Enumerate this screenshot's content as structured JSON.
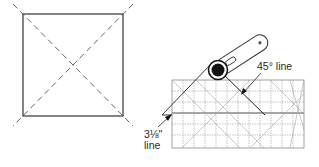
{
  "figures": {
    "left": {
      "name": "square-with-diagonals",
      "description": "Square block with two dashed diagonal placement lines extending past the corners"
    },
    "right": {
      "name": "ruler-and-rotary-cutter",
      "description": "Rotary cutter trimming along a quilting ruler aligned to the diagonal"
    }
  },
  "labels": {
    "angle_line": "45° line",
    "measure_line_top": "3⅛\"",
    "measure_line_bottom": "line"
  },
  "colors": {
    "stroke": "#333333",
    "grid": "#9a9a9a",
    "dashed": "#555555",
    "cutter_handle": "#ffffff",
    "cutter_wheel": "#111111"
  }
}
